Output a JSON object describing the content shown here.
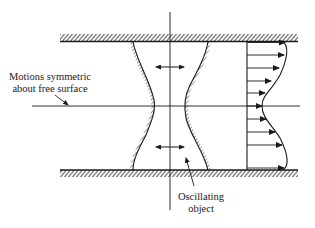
{
  "figure": {
    "labels": {
      "free_surface_line1": "Motions symmetric",
      "free_surface_line2": "about free surface",
      "object_line1": "Oscillating",
      "object_line2": "object"
    },
    "elements": {
      "top_wall": "fixed wall (hatched)",
      "bottom_wall": "fixed wall (hatched)",
      "free_surface": "horizontal symmetry line",
      "centerline": "vertical axis of object",
      "object": "oscillating object with hourglass profile",
      "oscillation_arrows": 2,
      "velocity_profile_arrows": 10
    },
    "colors": {
      "ink": "#1a1a1a",
      "background": "#ffffff"
    }
  }
}
